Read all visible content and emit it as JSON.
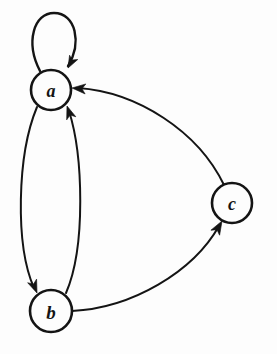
{
  "diagram": {
    "type": "directed-graph",
    "background_color": "#fdfdfd",
    "stroke_color": "#141414",
    "canvas": {
      "width": 277,
      "height": 354
    },
    "nodes": [
      {
        "id": "a",
        "label": "a",
        "cx": 51,
        "cy": 90,
        "r": 20,
        "font_size": 18
      },
      {
        "id": "b",
        "label": "b",
        "cx": 51,
        "cy": 311,
        "r": 21,
        "font_size": 19
      },
      {
        "id": "c",
        "label": "c",
        "cx": 232,
        "cy": 203,
        "r": 20,
        "font_size": 18
      }
    ],
    "edges": [
      {
        "id": "a-a",
        "from": "a",
        "to": "a",
        "kind": "self-loop",
        "path": "M 40 71 C 25 42, 34 13, 54 13 C 76 13, 82 43, 68 66",
        "arrow": {
          "x": 68,
          "y": 68,
          "angle": 118
        }
      },
      {
        "id": "a-b",
        "from": "a",
        "to": "b",
        "kind": "curve",
        "path": "M 37 107 C 17 155, 15 245, 34 288",
        "arrow": {
          "x": 37,
          "y": 293,
          "angle": 68
        }
      },
      {
        "id": "b-a",
        "from": "b",
        "to": "a",
        "kind": "curve",
        "path": "M 66 293 C 86 247, 83 155, 69 111",
        "arrow": {
          "x": 67,
          "y": 106,
          "angle": -109
        }
      },
      {
        "id": "b-c",
        "from": "b",
        "to": "c",
        "kind": "curve",
        "path": "M 72 311 C 132 308, 193 272, 219 226",
        "arrow": {
          "x": 222,
          "y": 221,
          "angle": -60
        }
      },
      {
        "id": "c-a",
        "from": "c",
        "to": "a",
        "kind": "curve",
        "path": "M 224 185 C 198 131, 137 92, 78 88",
        "arrow": {
          "x": 72,
          "y": 88,
          "angle": 184
        }
      }
    ]
  }
}
